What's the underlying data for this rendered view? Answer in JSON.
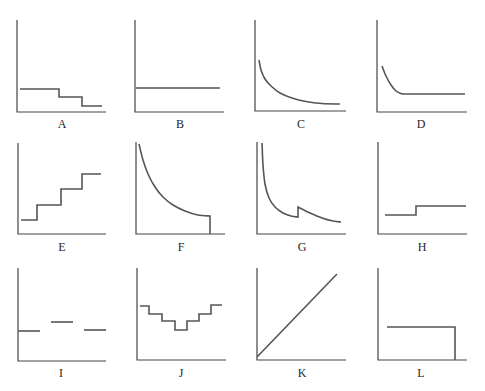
{
  "figure": {
    "line_color": "#555555",
    "axis_color": "#444444"
  },
  "chart_data": [
    {
      "id": "A",
      "label": "A",
      "type": "line",
      "shape": "decreasing step function (3 levels)",
      "title": "",
      "xlabel": "A",
      "ylabel": "",
      "grid": false,
      "axes": {
        "x0": 17,
        "y0": 112,
        "x1": 106,
        "ytop": 20
      },
      "points": [
        [
          20,
          89
        ],
        [
          59,
          89
        ],
        [
          59,
          97
        ],
        [
          82,
          97
        ],
        [
          82,
          106
        ],
        [
          102,
          106
        ]
      ]
    },
    {
      "id": "B",
      "label": "B",
      "type": "line",
      "shape": "constant horizontal line",
      "title": "",
      "xlabel": "B",
      "ylabel": "",
      "grid": false,
      "axes": {
        "x0": 135,
        "y0": 112,
        "x1": 224,
        "ytop": 20
      },
      "points": [
        [
          136,
          88
        ],
        [
          220,
          88
        ]
      ]
    },
    {
      "id": "C",
      "label": "C",
      "type": "line",
      "shape": "decreasing convex curve approaching asymptote",
      "title": "",
      "xlabel": "C",
      "ylabel": "",
      "grid": false,
      "axes": {
        "x0": 255,
        "y0": 111,
        "x1": 346,
        "ytop": 20
      },
      "points": [
        [
          259,
          60
        ],
        [
          261,
          70
        ],
        [
          265,
          79
        ],
        [
          271,
          86
        ],
        [
          280,
          93
        ],
        [
          292,
          98
        ],
        [
          306,
          101.5
        ],
        [
          322,
          103.5
        ],
        [
          340,
          104
        ]
      ]
    },
    {
      "id": "D",
      "label": "D",
      "type": "line",
      "shape": "steep decrease then constant",
      "title": "",
      "xlabel": "D",
      "ylabel": "",
      "grid": false,
      "axes": {
        "x0": 377,
        "y0": 112,
        "x1": 467,
        "ytop": 20
      },
      "points": [
        [
          382,
          66
        ],
        [
          386,
          76
        ],
        [
          391,
          85
        ],
        [
          396,
          91
        ],
        [
          402,
          94
        ],
        [
          465,
          94
        ]
      ]
    },
    {
      "id": "E",
      "label": "E",
      "type": "line",
      "shape": "increasing step function (4 levels)",
      "title": "",
      "xlabel": "E",
      "ylabel": "",
      "grid": false,
      "axes": {
        "x0": 18,
        "y0": 234,
        "x1": 106,
        "ytop": 143
      },
      "points": [
        [
          21,
          220
        ],
        [
          37,
          220
        ],
        [
          37,
          205
        ],
        [
          61,
          205
        ],
        [
          61,
          189
        ],
        [
          82,
          189
        ],
        [
          82,
          174
        ],
        [
          101,
          174
        ]
      ]
    },
    {
      "id": "F",
      "label": "F",
      "type": "line",
      "shape": "decreasing convex curve ending with vertical drop to zero",
      "title": "",
      "xlabel": "F",
      "ylabel": "",
      "grid": false,
      "axes": {
        "x0": 136,
        "y0": 234,
        "x1": 225,
        "ytop": 142
      },
      "points": [
        [
          139,
          144
        ],
        [
          143,
          160
        ],
        [
          148,
          174
        ],
        [
          155,
          187
        ],
        [
          163,
          197
        ],
        [
          173,
          205
        ],
        [
          185,
          211
        ],
        [
          198,
          215
        ],
        [
          210,
          216
        ],
        [
          210,
          234
        ]
      ]
    },
    {
      "id": "G",
      "label": "G",
      "type": "line",
      "shape": "decreasing curve with sudden upward jump then decline (sawtooth)",
      "title": "",
      "xlabel": "G",
      "ylabel": "",
      "grid": false,
      "axes": {
        "x0": 257,
        "y0": 234,
        "x1": 346,
        "ytop": 142
      },
      "points": [
        [
          262,
          143
        ],
        [
          263,
          165
        ],
        [
          265,
          184
        ],
        [
          269,
          198
        ],
        [
          275,
          207
        ],
        [
          283,
          213
        ],
        [
          291,
          216
        ],
        [
          298,
          217
        ],
        [
          298,
          207
        ],
        [
          310,
          213
        ],
        [
          322,
          218
        ],
        [
          333,
          221
        ],
        [
          341,
          222
        ]
      ]
    },
    {
      "id": "H",
      "label": "H",
      "type": "line",
      "shape": "single upward step",
      "title": "",
      "xlabel": "H",
      "ylabel": "",
      "grid": false,
      "axes": {
        "x0": 378,
        "y0": 234,
        "x1": 467,
        "ytop": 142
      },
      "points": [
        [
          385,
          215
        ],
        [
          416,
          215
        ],
        [
          416,
          206
        ],
        [
          466,
          206
        ]
      ]
    },
    {
      "id": "I",
      "label": "I",
      "type": "line",
      "shape": "three disconnected horizontal segments",
      "title": "",
      "xlabel": "I",
      "ylabel": "",
      "grid": false,
      "axes": {
        "x0": 18,
        "y0": 361,
        "x1": 106,
        "ytop": 268
      },
      "segments": [
        [
          [
            18,
            331
          ],
          [
            40,
            331
          ]
        ],
        [
          [
            51,
            322
          ],
          [
            73,
            322
          ]
        ],
        [
          [
            84,
            330
          ],
          [
            106,
            330
          ]
        ]
      ]
    },
    {
      "id": "J",
      "label": "J",
      "type": "line",
      "shape": "U-shaped step function (down then up)",
      "title": "",
      "xlabel": "J",
      "ylabel": "",
      "grid": false,
      "axes": {
        "x0": 137,
        "y0": 360,
        "x1": 226,
        "ytop": 268
      },
      "points": [
        [
          140,
          306
        ],
        [
          149,
          306
        ],
        [
          149,
          314
        ],
        [
          162,
          314
        ],
        [
          162,
          321
        ],
        [
          175,
          321
        ],
        [
          175,
          330
        ],
        [
          187,
          330
        ],
        [
          187,
          321
        ],
        [
          199,
          321
        ],
        [
          199,
          314
        ],
        [
          211,
          314
        ],
        [
          211,
          305
        ],
        [
          222,
          305
        ]
      ]
    },
    {
      "id": "K",
      "label": "K",
      "type": "line",
      "shape": "straight line increasing from origin",
      "title": "",
      "xlabel": "K",
      "ylabel": "",
      "grid": false,
      "axes": {
        "x0": 257,
        "y0": 360,
        "x1": 346,
        "ytop": 268
      },
      "points": [
        [
          257,
          357
        ],
        [
          337,
          274
        ]
      ]
    },
    {
      "id": "L",
      "label": "L",
      "type": "line",
      "shape": "constant then vertical drop to zero",
      "title": "",
      "xlabel": "L",
      "ylabel": "",
      "grid": false,
      "axes": {
        "x0": 378,
        "y0": 360,
        "x1": 467,
        "ytop": 268
      },
      "points": [
        [
          387,
          327
        ],
        [
          455,
          327
        ],
        [
          455,
          360
        ]
      ]
    }
  ],
  "labels": [
    {
      "text": "A",
      "x": 62,
      "y": 117
    },
    {
      "text": "B",
      "x": 180,
      "y": 117
    },
    {
      "text": "C",
      "x": 301,
      "y": 117
    },
    {
      "text": "D",
      "x": 421,
      "y": 117
    },
    {
      "text": "E",
      "x": 62,
      "y": 240
    },
    {
      "text": "F",
      "x": 181,
      "y": 240
    },
    {
      "text": "G",
      "x": 302,
      "y": 240
    },
    {
      "text": "H",
      "x": 422,
      "y": 240
    },
    {
      "text": "I",
      "x": 61,
      "y": 366
    },
    {
      "text": "J",
      "x": 181,
      "y": 366
    },
    {
      "text": "K",
      "x": 302,
      "y": 366
    },
    {
      "text": "L",
      "x": 421,
      "y": 366
    }
  ]
}
